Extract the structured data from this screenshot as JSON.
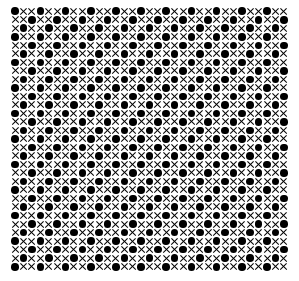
{
  "pattern": {
    "rows": 31,
    "cols": 33,
    "rule": "dot when (row + col) % 3 == 0, otherwise cross",
    "symbols": {
      "dot": "filled-circle",
      "cross": "x-mark"
    },
    "colors": {
      "background": "#ffffff",
      "ink": "#000000"
    }
  }
}
